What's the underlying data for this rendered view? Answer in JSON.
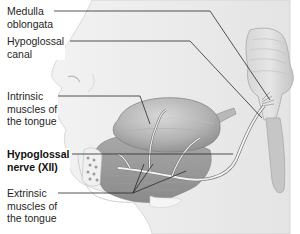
{
  "figure": {
    "colors": {
      "background": "#ffffff",
      "tissue_light": "#e9e9e9",
      "tissue_mid": "#c9c9c9",
      "tissue_dark": "#9a9a9a",
      "nerve": "#f4f4f4",
      "leader_line": "#2a2a2a",
      "label_text": "#1f1f1f"
    }
  },
  "labels": [
    {
      "id": "medulla-oblongata",
      "lines": [
        "Medulla",
        "oblongata"
      ],
      "bold": false
    },
    {
      "id": "hypoglossal-canal",
      "lines": [
        "Hypoglossal",
        "canal"
      ],
      "bold": false
    },
    {
      "id": "intrinsic-muscles",
      "lines": [
        "Intrinsic",
        "muscles of",
        "the tongue"
      ],
      "bold": false
    },
    {
      "id": "hypoglossal-nerve",
      "lines": [
        "Hypoglossal",
        "nerve (XII)"
      ],
      "bold": true
    },
    {
      "id": "extrinsic-muscles",
      "lines": [
        "Extrinsic",
        "muscles of",
        "the tongue"
      ],
      "bold": false
    }
  ]
}
